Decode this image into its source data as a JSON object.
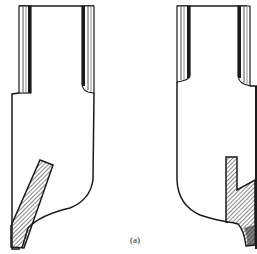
{
  "figure": {
    "label": "(a)",
    "colors": {
      "line": "#1a1a1a",
      "background": "#ffffff",
      "hatch": "#333333"
    }
  },
  "tools": [
    {
      "name": "left-tool",
      "insert": "inclined blade"
    },
    {
      "name": "right-tool",
      "insert": "vertical notched insert"
    }
  ]
}
